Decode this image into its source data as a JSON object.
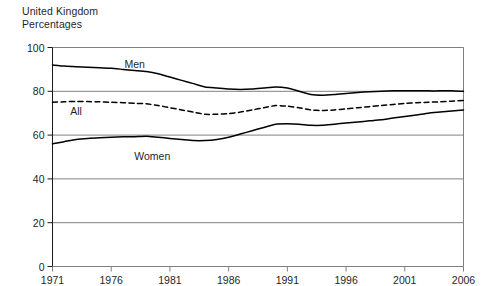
{
  "header": {
    "country": "United Kingdom",
    "units": "Percentages"
  },
  "chart_data": {
    "type": "line",
    "title": "",
    "subtitle": "",
    "xlabel": "",
    "ylabel": "",
    "units": "Percentages",
    "region": "United Kingdom",
    "xlim": [
      1971,
      2006
    ],
    "ylim": [
      0,
      100
    ],
    "xticks": [
      "1971",
      "1976",
      "1981",
      "1986",
      "1991",
      "1996",
      "2001",
      "2006"
    ],
    "xtick_values": [
      1971,
      1976,
      1981,
      1986,
      1991,
      1996,
      2001,
      2006
    ],
    "yticks": [
      "0",
      "20",
      "40",
      "60",
      "80",
      "100"
    ],
    "ytick_values": [
      0,
      20,
      40,
      60,
      80,
      100
    ],
    "grid": "horizontal",
    "legend": "inline-labels",
    "x": [
      1971,
      1972,
      1973,
      1974,
      1975,
      1976,
      1977,
      1978,
      1979,
      1980,
      1981,
      1982,
      1983,
      1984,
      1985,
      1986,
      1987,
      1988,
      1989,
      1990,
      1991,
      1992,
      1993,
      1994,
      1995,
      1996,
      1997,
      1998,
      1999,
      2000,
      2001,
      2002,
      2003,
      2004,
      2005,
      2006
    ],
    "series": [
      {
        "name": "Men",
        "style": "solid",
        "color": "#000000",
        "label_position": {
          "x": 1978.0,
          "y": 90.5
        },
        "values": [
          92.0,
          91.5,
          91.2,
          91.0,
          90.8,
          90.5,
          90.0,
          89.5,
          89.0,
          88.0,
          86.5,
          85.0,
          83.5,
          82.0,
          81.5,
          81.0,
          80.8,
          81.0,
          81.5,
          82.0,
          81.5,
          80.0,
          78.5,
          78.2,
          78.5,
          79.0,
          79.5,
          79.8,
          80.0,
          80.2,
          80.3,
          80.3,
          80.2,
          80.2,
          80.3,
          80.0
        ]
      },
      {
        "name": "All",
        "style": "dashed",
        "color": "#000000",
        "label_position": {
          "x": 1973.0,
          "y": 69.0
        },
        "values": [
          75.0,
          75.2,
          75.4,
          75.3,
          75.2,
          75.0,
          74.8,
          74.5,
          74.3,
          73.5,
          72.5,
          71.5,
          70.5,
          69.5,
          69.5,
          69.8,
          70.5,
          71.5,
          72.5,
          73.5,
          73.2,
          72.5,
          71.5,
          71.2,
          71.5,
          72.0,
          72.5,
          73.0,
          73.5,
          74.0,
          74.5,
          74.8,
          75.0,
          75.2,
          75.5,
          75.8
        ]
      },
      {
        "name": "Women",
        "style": "solid",
        "color": "#000000",
        "label_position": {
          "x": 1979.5,
          "y": 48.5
        },
        "values": [
          56.0,
          57.0,
          58.0,
          58.5,
          58.8,
          59.0,
          59.2,
          59.3,
          59.5,
          59.0,
          58.5,
          58.0,
          57.5,
          57.5,
          58.0,
          59.0,
          60.5,
          62.0,
          63.5,
          65.0,
          65.2,
          65.0,
          64.5,
          64.5,
          65.0,
          65.5,
          66.0,
          66.5,
          67.0,
          67.8,
          68.5,
          69.2,
          70.0,
          70.5,
          71.0,
          71.5
        ]
      }
    ]
  }
}
